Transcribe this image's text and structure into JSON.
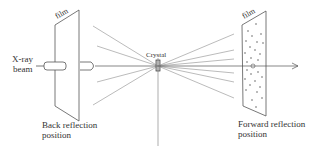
{
  "labels": {
    "xray": [
      "X-ray",
      "beam"
    ],
    "film_back": "film",
    "film_forward": "film",
    "crystal": "Crystal",
    "back_position": [
      "Back reflection",
      "position"
    ],
    "forward_position": [
      "Forward reflection",
      "position"
    ]
  },
  "colors": {
    "line": "#555555",
    "text": "#333333"
  }
}
